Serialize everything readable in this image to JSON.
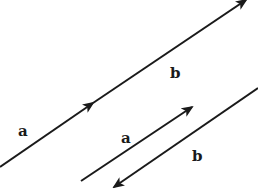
{
  "diagram": {
    "type": "vector-addition",
    "colors": {
      "stroke": "#1a1a1a",
      "background": "#ffffff"
    },
    "vectors": [
      {
        "id": "a-main",
        "label": "a",
        "x1": 0,
        "y1": 167,
        "x2": 93,
        "y2": 103,
        "arrow": "end"
      },
      {
        "id": "b-main",
        "label": "b",
        "x1": 93,
        "y1": 103,
        "x2": 246,
        "y2": 0,
        "arrow": "end"
      },
      {
        "id": "a-second",
        "label": "a",
        "x1": 81,
        "y1": 181,
        "x2": 192,
        "y2": 107,
        "arrow": "end"
      },
      {
        "id": "b-reverse",
        "label": "b",
        "x1": 258,
        "y1": 88,
        "x2": 114,
        "y2": 187,
        "arrow": "end"
      }
    ],
    "labels": [
      {
        "text": "a",
        "x": 18,
        "y": 136
      },
      {
        "text": "b",
        "x": 170,
        "y": 78
      },
      {
        "text": "a",
        "x": 121,
        "y": 143
      },
      {
        "text": "b",
        "x": 192,
        "y": 161
      }
    ]
  }
}
